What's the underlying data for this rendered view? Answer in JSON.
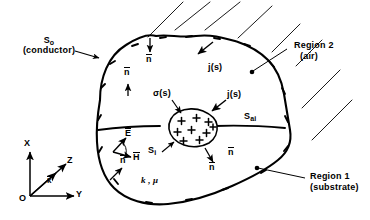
{
  "figure": {
    "type": "electromagnetic-boundary-diagram",
    "background_color": "#ffffff",
    "ink_color": "#000000"
  },
  "labels": {
    "outer_surface": "S",
    "outer_surface_sub": "o",
    "outer_surface_paren": "(conductor)",
    "region2_name": "Region 2",
    "region2_paren": "(air)",
    "region1_name": "Region 1",
    "region1_paren": "(substrate)",
    "interface_surface": "S",
    "interface_surface_sub": "ai",
    "inner_surface": "S",
    "inner_surface_sub": "i",
    "surface_charge": "σ(s)",
    "surface_current_top": "j(s)",
    "surface_current_inner": "j(s)",
    "material_params": "k , μ",
    "normal_1": "n",
    "normal_2": "n",
    "normal_3": "n",
    "normal_4": "n",
    "normal_5": "n",
    "efield": "E",
    "hfield": "H"
  },
  "axes": {
    "x_label": "X",
    "y_label": "Y",
    "z_label": "Z",
    "origin_label": "O",
    "wave_vector": "k"
  },
  "charges": {
    "inner_plus_count": 9,
    "plus_symbol": "+",
    "outer_minus_symbol": "–"
  }
}
